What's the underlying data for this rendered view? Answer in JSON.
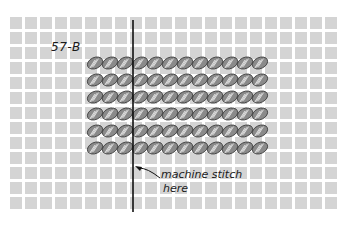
{
  "figure": {
    "label": "57-B",
    "annotation_line1": "machine stitch",
    "annotation_line2": "here"
  },
  "grid": {
    "origin_x": 10,
    "origin_y": 17,
    "pitch": 15,
    "cell": 12,
    "cols": 22,
    "rows": 13,
    "color": "#d4d4d4"
  },
  "beads": {
    "x0": 88,
    "y0": 56,
    "cols": 12,
    "rows": 6,
    "dx": 15,
    "dy": 17,
    "fill": "#8a8a8a",
    "stroke": "#3a3a3a",
    "stripe": "#e6e6e6"
  },
  "stitch_line": {
    "x": 133,
    "y1": 20,
    "y2": 212,
    "color": "#111111"
  },
  "arrow": {
    "from": [
      160,
      178
    ],
    "to": [
      135,
      166
    ]
  }
}
